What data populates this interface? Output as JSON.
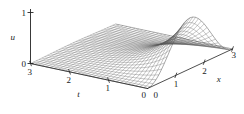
{
  "figure": {
    "type": "surface-mesh-3d",
    "background_color": "#ffffff",
    "line_color": "#555555",
    "axis_color": "#222222",
    "width": 244,
    "height": 114
  },
  "axes": {
    "vertical": {
      "name": "u",
      "label": "u",
      "ticks": [
        {
          "value": 0,
          "label": "0"
        },
        {
          "value": 1,
          "label": "1"
        }
      ],
      "range": [
        0,
        1
      ]
    },
    "depth": {
      "name": "t",
      "label": "t",
      "ticks": [
        {
          "value": 3,
          "label": "3"
        },
        {
          "value": 2,
          "label": "2"
        },
        {
          "value": 1,
          "label": "1"
        },
        {
          "value": 0,
          "label": "0"
        }
      ],
      "range": [
        0,
        3
      ]
    },
    "horizontal": {
      "name": "x",
      "label": "x",
      "ticks": [
        {
          "value": 0,
          "label": "0"
        },
        {
          "value": 1,
          "label": "1"
        },
        {
          "value": 2,
          "label": "2"
        },
        {
          "value": 3,
          "label": "3"
        }
      ],
      "range": [
        0,
        3
      ]
    }
  },
  "chart_data": {
    "type": "surface",
    "title": "",
    "xlabel": "x",
    "ylabel": "t",
    "zlabel": "u",
    "xlim": [
      0,
      3
    ],
    "ylim": [
      0,
      3
    ],
    "zlim": [
      0,
      1
    ],
    "grid": false,
    "legend": null,
    "mesh": {
      "nx": 31,
      "nt": 31,
      "description": "Wireframe mesh surface u(x,t); a hump of height near 1 rises along the x axis around x=2 at t=0 and decays toward zero as t increases; surface is flat (u=0) at large t and at the x=0 and x=3 edges."
    },
    "surface_model": {
      "form": "u(x,t) = sin(pi*x/3)^2 * exp(-1.35*t) * peak",
      "peak": 1.0,
      "decay_rate": 1.35,
      "peak_x": 2.0,
      "peak_t": 0.0
    }
  }
}
